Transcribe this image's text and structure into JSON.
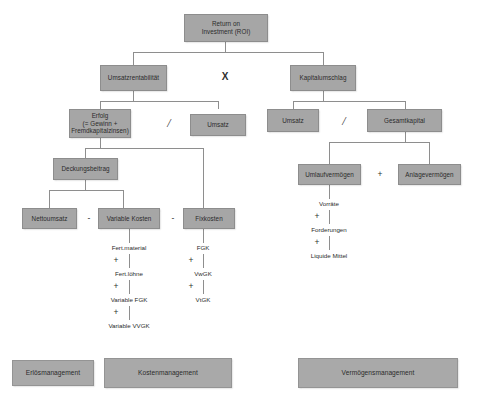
{
  "diagram": {
    "colors": {
      "box_fill": "#a6a6a6",
      "box_border": "#8d8d8d",
      "line": "#8e8e8e",
      "text": "#2b2b2b",
      "background": "#ffffff"
    }
  },
  "nodes": {
    "roi": "Return on\nInvestment (ROI)",
    "roi_line1": "Return on",
    "roi_line2": "Investment (ROI)",
    "umsatzrentabilitaet": "Umsatzrentabilität",
    "kapitalumschlag": "Kapitalumschlag",
    "erfolg_line1": "Erfolg",
    "erfolg_line2": "(= Gewinn +",
    "erfolg_line3": "Fremdkapitalzinsen)",
    "umsatz_left": "Umsatz",
    "umsatz_right": "Umsatz",
    "gesamtkapital": "Gesamtkapital",
    "deckungsbeitrag": "Deckungsbeitrag",
    "umlaufvermoegen": "Umlaufvermögen",
    "anlagevermoegen": "Anlagevermögen",
    "nettoumsatz": "Nettoumsatz",
    "variable_kosten": "Variable Kosten",
    "fixkosten": "Fixkosten"
  },
  "operators": {
    "multiply": "X",
    "divide_left": "/",
    "divide_right": "/",
    "minus_1": "-",
    "minus_2": "-",
    "plus_assets": "+",
    "plus_vk_1": "+",
    "plus_vk_2": "+",
    "plus_vk_3": "+",
    "plus_fk_1": "+",
    "plus_fk_2": "+",
    "plus_uv_1": "+",
    "plus_uv_2": "+"
  },
  "variable_kosten_items": [
    "Fert.material",
    "Fert.löhne",
    "Variable FGK",
    "Variable VVGK"
  ],
  "fixkosten_items": [
    "FGK",
    "VwGK",
    "VtGK"
  ],
  "umlaufvermoegen_items": [
    "Vorräte",
    "Forderungen",
    "Liquide Mittel"
  ],
  "management_boxes": [
    "Erlösmanagement",
    "Kostenmanagement",
    "Vermögensmanagement"
  ]
}
